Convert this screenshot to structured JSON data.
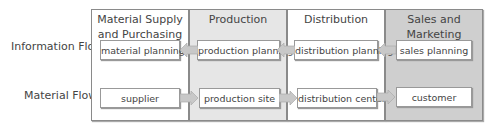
{
  "rows": [
    {
      "label": "Information Flow"
    },
    {
      "label": "Material Flow"
    }
  ],
  "columns": [
    {
      "title": "Material Supply and Purchasing",
      "title_line1": "Material Supply",
      "title_line2": "and Purchasing",
      "bg": "#ffffff",
      "info_box": "material planning",
      "material_box": "supplier"
    },
    {
      "title": "Production",
      "bg": "#e6e6e6",
      "info_box": "production planning",
      "material_box": "production site"
    },
    {
      "title": "Distribution",
      "bg": "#ffffff",
      "info_box": "distribution planning",
      "material_box": "distribution center"
    },
    {
      "title": "Sales and Marketing",
      "bg": "#cfcfcf",
      "info_box": "sales planning",
      "material_box": "customer"
    }
  ],
  "arrows": {
    "information_flow_direction": "left",
    "material_flow_direction": "right",
    "color": "#c8c8c8"
  }
}
